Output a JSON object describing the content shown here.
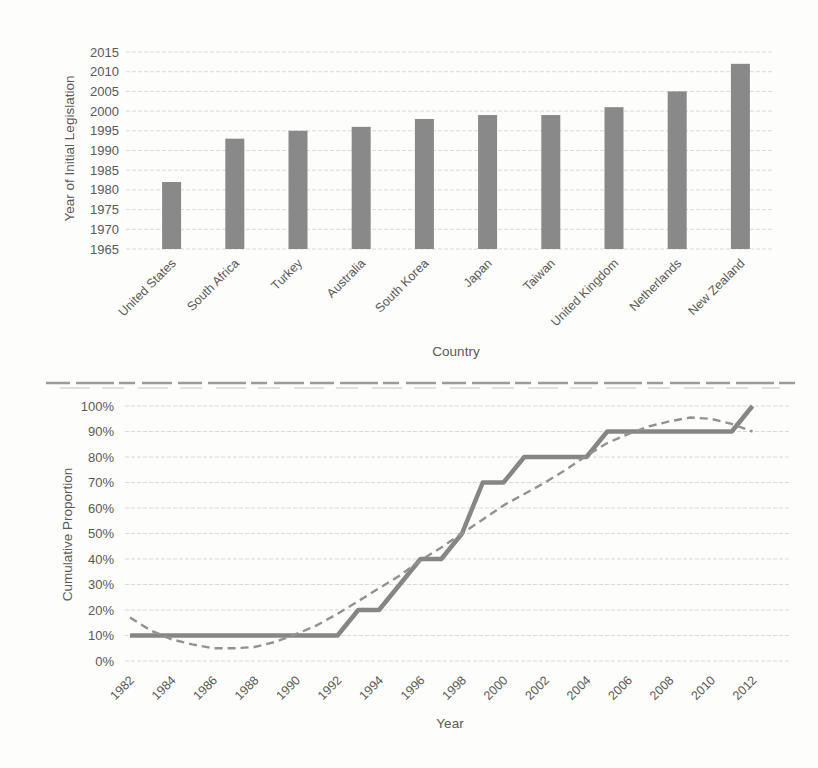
{
  "figure_type": "scanned-two-panel-figure",
  "colors": {
    "background": "#fdfdfb",
    "text": "#595959",
    "gridline": "#d9d9d9",
    "bar": "#898989",
    "solid_line": "#868686",
    "dashed_line": "#929292",
    "divider": "#9d9b96"
  },
  "chart_data": [
    {
      "type": "bar",
      "title": "",
      "ylabel": "Year of Initial Legislation",
      "xlabel": "Country",
      "categories": [
        "United States",
        "South Africa",
        "Turkey",
        "Australia",
        "South Korea",
        "Japan",
        "Taiwan",
        "United Kingdom",
        "Netherlands",
        "New Zealand"
      ],
      "values": [
        1982,
        1993,
        1995,
        1996,
        1998,
        1999,
        1999,
        2001,
        2005,
        2012
      ],
      "baseline": 1965,
      "ylim": [
        1965,
        2015
      ],
      "yticks": [
        1965,
        1970,
        1975,
        1980,
        1985,
        1990,
        1995,
        2000,
        2005,
        2010,
        2015
      ],
      "ytick_labels": [
        "1965",
        "1970",
        "1975",
        "1980",
        "1985",
        "1990",
        "1995",
        "2000",
        "2005",
        "2010",
        "2015"
      ],
      "grid": true,
      "legend": "none"
    },
    {
      "type": "line",
      "title": "",
      "ylabel": "Cumulative Proportion",
      "xlabel": "Year",
      "xlim": [
        1982,
        2012
      ],
      "ylim": [
        0,
        100
      ],
      "xticks": [
        1982,
        1984,
        1986,
        1988,
        1990,
        1992,
        1994,
        1996,
        1998,
        2000,
        2002,
        2004,
        2006,
        2008,
        2010,
        2012
      ],
      "xtick_labels": [
        "1982",
        "1984",
        "1986",
        "1988",
        "1990",
        "1992",
        "1994",
        "1996",
        "1998",
        "2000",
        "2002",
        "2004",
        "2006",
        "2008",
        "2010",
        "2012"
      ],
      "yticks": [
        0,
        10,
        20,
        30,
        40,
        50,
        60,
        70,
        80,
        90,
        100
      ],
      "ytick_labels": [
        "0%",
        "10%",
        "20%",
        "30%",
        "40%",
        "50%",
        "60%",
        "70%",
        "80%",
        "90%",
        "100%"
      ],
      "x": [
        1982,
        1983,
        1984,
        1985,
        1986,
        1987,
        1988,
        1989,
        1990,
        1991,
        1992,
        1993,
        1994,
        1995,
        1996,
        1997,
        1998,
        1999,
        2000,
        2001,
        2002,
        2003,
        2004,
        2005,
        2006,
        2007,
        2008,
        2009,
        2010,
        2011,
        2012
      ],
      "series": [
        {
          "name": "cumulative-proportion-actual",
          "style": "solid",
          "values": [
            10,
            10,
            10,
            10,
            10,
            10,
            10,
            10,
            10,
            10,
            10,
            20,
            20,
            30,
            40,
            40,
            50,
            70,
            70,
            80,
            80,
            80,
            80,
            90,
            90,
            90,
            90,
            90,
            90,
            90,
            100
          ]
        },
        {
          "name": "fitted-trend",
          "style": "dashed",
          "values": [
            17,
            12,
            8.5,
            6.5,
            5,
            5,
            5.5,
            7.5,
            10.5,
            14,
            18.5,
            23.5,
            28.5,
            33.5,
            39.5,
            44.5,
            50,
            55.5,
            61,
            65.5,
            70,
            75,
            80.5,
            85.5,
            89,
            92,
            94,
            95.5,
            95,
            93,
            90
          ]
        }
      ],
      "grid": true,
      "legend": "none"
    }
  ]
}
